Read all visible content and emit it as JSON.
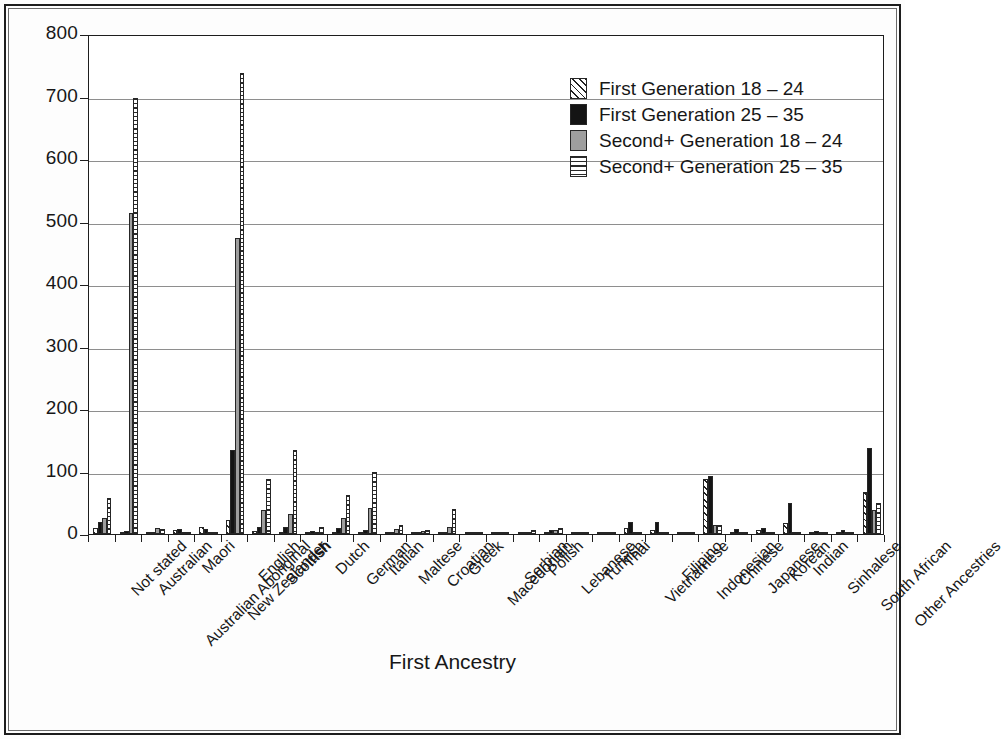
{
  "chart_data": {
    "type": "bar",
    "title": "",
    "xlabel": "First Ancestry",
    "ylabel": "Number (,ooo)",
    "ylim": [
      0,
      800
    ],
    "ytick_labels": [
      "0",
      "100",
      "200",
      "300",
      "400",
      "500",
      "600",
      "700",
      "800"
    ],
    "ytick_values": [
      0,
      100,
      200,
      300,
      400,
      500,
      600,
      700,
      800
    ],
    "grid": "horizontal",
    "legend_position": "top-right",
    "categories": [
      "Not stated",
      "Australian",
      "Australian Aboriginal",
      "Maori",
      "New Zealander",
      "English",
      "Scottish",
      "Irish",
      "Dutch",
      "German",
      "Italian",
      "Maltese",
      "Croatian",
      "Greek",
      "Macedonian",
      "Serbian",
      "Polish",
      "Lebanese",
      "Turkish",
      "Thai",
      "Vietnamese",
      "Filipino",
      "Indonesian",
      "Chinese",
      "Japanese",
      "Korean",
      "Indian",
      "Sinhalese",
      "South African",
      "Other Ancestries"
    ],
    "series": [
      {
        "name": "First Generation 18 – 24",
        "pattern": "diagonal-hatch",
        "color": "#ffffff",
        "values": [
          9,
          2,
          1,
          6,
          11,
          22,
          5,
          4,
          1,
          3,
          2,
          1,
          1,
          2,
          1,
          1,
          1,
          3,
          1,
          4,
          9,
          7,
          3,
          88,
          4,
          7,
          18,
          3,
          4,
          68
        ]
      },
      {
        "name": "First Generation 25 – 35",
        "pattern": "solid-black",
        "color": "#141414",
        "values": [
          20,
          5,
          1,
          8,
          8,
          135,
          12,
          11,
          5,
          10,
          6,
          2,
          2,
          3,
          3,
          4,
          4,
          6,
          3,
          4,
          20,
          19,
          4,
          93,
          8,
          9,
          50,
          5,
          6,
          137
        ]
      },
      {
        "name": "Second+ Generation 18 – 24",
        "pattern": "solid-gray",
        "color": "#9e9e9e",
        "values": [
          25,
          513,
          9,
          3,
          3,
          474,
          38,
          32,
          4,
          26,
          42,
          8,
          5,
          12,
          3,
          2,
          3,
          7,
          2,
          1,
          4,
          3,
          1,
          15,
          2,
          1,
          3,
          1,
          2,
          38
        ]
      },
      {
        "name": "Second+ Generation 25 – 35",
        "pattern": "horizontal-lines",
        "color": "#ffffff",
        "values": [
          58,
          697,
          8,
          3,
          2,
          738,
          88,
          135,
          11,
          62,
          100,
          14,
          7,
          40,
          4,
          3,
          6,
          9,
          2,
          1,
          3,
          2,
          1,
          15,
          2,
          1,
          3,
          1,
          2,
          50
        ]
      }
    ]
  },
  "legend": {
    "items": [
      {
        "label": "First Generation 18 – 24",
        "pattern": "diagonal-hatch"
      },
      {
        "label": "First Generation 25 – 35",
        "pattern": "solid-black"
      },
      {
        "label": "Second+ Generation 18 – 24",
        "pattern": "solid-gray"
      },
      {
        "label": "Second+ Generation 25 – 35",
        "pattern": "horizontal-lines"
      }
    ]
  }
}
